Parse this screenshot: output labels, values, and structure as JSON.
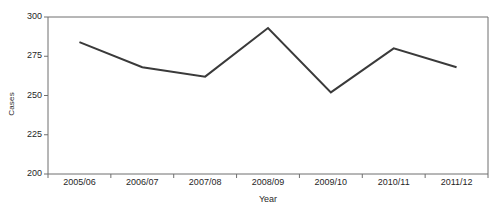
{
  "chart_data": {
    "type": "line",
    "title": "",
    "xlabel": "Year",
    "ylabel": "Cases",
    "categories": [
      "2005/06",
      "2006/07",
      "2007/08",
      "2008/09",
      "2009/10",
      "2010/11",
      "2011/12"
    ],
    "values": [
      284,
      268,
      262,
      293,
      252,
      280,
      268
    ],
    "series": [
      {
        "name": "Cases",
        "values": [
          284,
          268,
          262,
          293,
          252,
          280,
          268
        ]
      }
    ],
    "ylim": [
      200,
      300
    ],
    "yticks": [
      200,
      225,
      250,
      275,
      300
    ],
    "ytick_labels": [
      "200",
      "225",
      "250",
      "275",
      "300"
    ],
    "grid": false,
    "legend": false,
    "legend_position": "none",
    "line_color": "#3a3a3a",
    "line_width": 2,
    "markers": false,
    "axis_color": "#6f6f6f",
    "background": "#ffffff"
  },
  "axes": {
    "x_title": "Year",
    "y_title": "Cases"
  }
}
